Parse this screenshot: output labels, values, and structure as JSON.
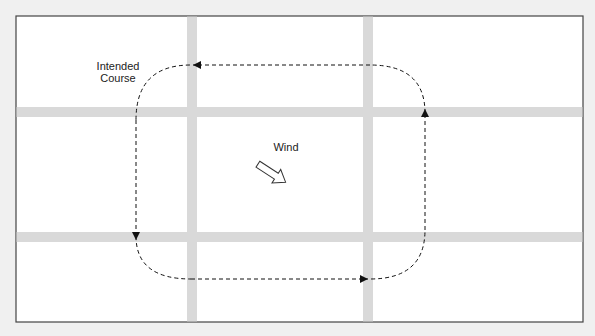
{
  "diagram": {
    "labels": {
      "intended_course_line1": "Intended",
      "intended_course_line2": "Course",
      "wind": "Wind"
    },
    "frame": {
      "x": 16,
      "y": 16,
      "width": 567,
      "height": 306
    },
    "roads": {
      "vertical_x": [
        192,
        368
      ],
      "horizontal_y": [
        112,
        237
      ],
      "width": 10,
      "color": "#d9d9d9"
    },
    "course": {
      "left_x": 136,
      "right_x": 425,
      "top_y": 65,
      "bottom_y": 279,
      "corner_radius": 55,
      "direction": "counter-clockwise",
      "color": "#111111"
    },
    "wind_arrow": {
      "direction": "south-east",
      "icon": "hollow-arrow-icon"
    },
    "colors": {
      "background": "#f0f0f0",
      "frame_fill": "#ffffff",
      "frame_border": "#444444"
    }
  }
}
